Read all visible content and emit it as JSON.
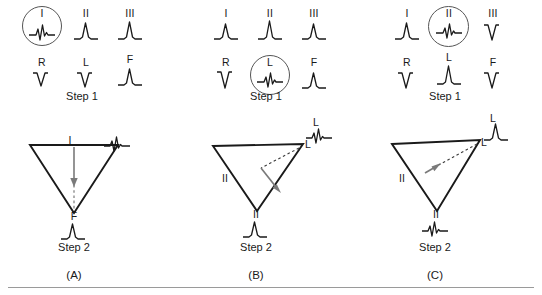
{
  "figure": {
    "bottom_rule": true,
    "ink_color": "#1a1a1a",
    "circle_color": "#555555",
    "arrow_color": "#6e6e6e",
    "rule_color": "#9a9a9a"
  },
  "panels": [
    {
      "id": "A",
      "letter": "(A)",
      "step1_label": "Step 1",
      "step2_label": "Step 2",
      "leads_row1": [
        {
          "name": "I",
          "wave": "biphasic",
          "circled": true
        },
        {
          "name": "II",
          "wave": "positive",
          "circled": false
        },
        {
          "name": "III",
          "wave": "positive",
          "circled": false
        }
      ],
      "leads_row2": [
        {
          "name": "R",
          "wave": "negative",
          "circled": false
        },
        {
          "name": "L",
          "wave": "negative",
          "circled": false
        },
        {
          "name": "F",
          "wave": "positive",
          "circled": false
        }
      ],
      "triangle": {
        "top_label": "I",
        "apex_label": "F",
        "apex_wave": "positive",
        "side_label": "",
        "arrow_direction": "down",
        "arrow_from": "top-edge-center",
        "arrow_to": "apex",
        "vertex_wave": "biphasic",
        "vertex_wave_label": "",
        "vertex_wave_position": "right"
      }
    },
    {
      "id": "B",
      "letter": "(B)",
      "step1_label": "Step 1",
      "step2_label": "Step 2",
      "leads_row1": [
        {
          "name": "I",
          "wave": "positive",
          "circled": false
        },
        {
          "name": "II",
          "wave": "positive",
          "circled": false
        },
        {
          "name": "III",
          "wave": "positive",
          "circled": false
        }
      ],
      "leads_row2": [
        {
          "name": "R",
          "wave": "negative",
          "circled": false
        },
        {
          "name": "L",
          "wave": "biphasic",
          "circled": true
        },
        {
          "name": "F",
          "wave": "positive",
          "circled": false
        }
      ],
      "triangle": {
        "top_label": "",
        "apex_label": "II",
        "apex_wave": "positive",
        "side_label": "II",
        "arrow_direction": "down-left",
        "arrow_from": "right-vertex",
        "arrow_to": "lower-left-interior",
        "vertex_wave": "biphasic",
        "vertex_wave_label": "L",
        "vertex_label": "L",
        "vertex_wave_position": "upper-right"
      }
    },
    {
      "id": "C",
      "letter": "(C)",
      "step1_label": "Step 1",
      "step2_label": "Step 2",
      "leads_row1": [
        {
          "name": "I",
          "wave": "positive",
          "circled": false
        },
        {
          "name": "II",
          "wave": "biphasic",
          "circled": true
        },
        {
          "name": "III",
          "wave": "negative",
          "circled": false
        }
      ],
      "leads_row2": [
        {
          "name": "R",
          "wave": "negative",
          "circled": false
        },
        {
          "name": "L",
          "wave": "positive",
          "circled": false
        },
        {
          "name": "F",
          "wave": "negative",
          "circled": false
        }
      ],
      "triangle": {
        "top_label": "",
        "apex_label": "II",
        "apex_wave": "biphasic",
        "side_label": "II",
        "arrow_direction": "up-right",
        "arrow_from": "lower-left-interior",
        "arrow_to": "right-vertex",
        "vertex_wave": "positive",
        "vertex_wave_label": "L",
        "vertex_label": "L",
        "vertex_wave_position": "upper-right"
      }
    }
  ]
}
